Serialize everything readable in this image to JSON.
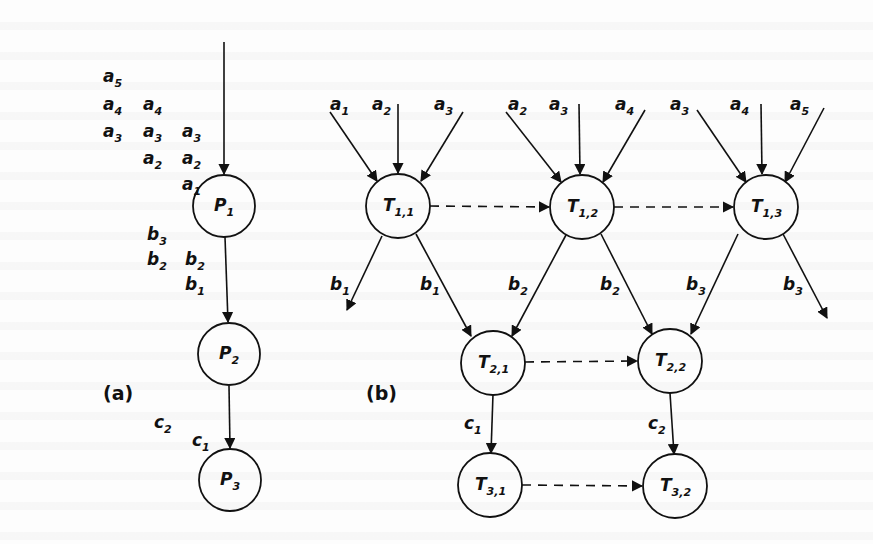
{
  "figure": {
    "panel_a": {
      "label": "(a)",
      "nodes": [
        {
          "id": "P1",
          "base": "P",
          "sub": "1",
          "cx": 224,
          "cy": 206
        },
        {
          "id": "P2",
          "base": "P",
          "sub": "2",
          "cx": 229,
          "cy": 354
        },
        {
          "id": "P3",
          "base": "P",
          "sub": "3",
          "cx": 230,
          "cy": 480
        }
      ],
      "input_stream": [
        {
          "base": "a",
          "sub": "5",
          "x": 103,
          "y": 82
        },
        {
          "base": "a",
          "sub": "4",
          "x": 103,
          "y": 110
        },
        {
          "base": "a",
          "sub": "4",
          "x": 143,
          "y": 110
        },
        {
          "base": "a",
          "sub": "3",
          "x": 103,
          "y": 137
        },
        {
          "base": "a",
          "sub": "3",
          "x": 143,
          "y": 137
        },
        {
          "base": "a",
          "sub": "3",
          "x": 182,
          "y": 137
        },
        {
          "base": "a",
          "sub": "2",
          "x": 143,
          "y": 164
        },
        {
          "base": "a",
          "sub": "2",
          "x": 182,
          "y": 164
        },
        {
          "base": "a",
          "sub": "1",
          "x": 182,
          "y": 190
        }
      ],
      "b_stream": [
        {
          "base": "b",
          "sub": "3",
          "x": 147,
          "y": 240
        },
        {
          "base": "b",
          "sub": "2",
          "x": 147,
          "y": 265
        },
        {
          "base": "b",
          "sub": "2",
          "x": 185,
          "y": 265
        },
        {
          "base": "b",
          "sub": "1",
          "x": 185,
          "y": 290
        }
      ],
      "c_stream": [
        {
          "base": "c",
          "sub": "2",
          "x": 154,
          "y": 428
        },
        {
          "base": "c",
          "sub": "1",
          "x": 192,
          "y": 446
        }
      ]
    },
    "panel_b": {
      "label": "(b)",
      "nodes": [
        {
          "id": "T11",
          "base": "T",
          "sub": "1,1",
          "cx": 398,
          "cy": 206
        },
        {
          "id": "T12",
          "base": "T",
          "sub": "1,2",
          "cx": 582,
          "cy": 207
        },
        {
          "id": "T13",
          "base": "T",
          "sub": "1,3",
          "cx": 766,
          "cy": 207
        },
        {
          "id": "T21",
          "base": "T",
          "sub": "2,1",
          "cx": 493,
          "cy": 363
        },
        {
          "id": "T22",
          "base": "T",
          "sub": "2,2",
          "cx": 670,
          "cy": 361
        },
        {
          "id": "T31",
          "base": "T",
          "sub": "3,1",
          "cx": 490,
          "cy": 485
        },
        {
          "id": "T32",
          "base": "T",
          "sub": "3,2",
          "cx": 675,
          "cy": 486
        }
      ],
      "input_labels": [
        {
          "base": "a",
          "sub": "1",
          "x": 330,
          "y": 110
        },
        {
          "base": "a",
          "sub": "2",
          "x": 372,
          "y": 110
        },
        {
          "base": "a",
          "sub": "3",
          "x": 434,
          "y": 110
        },
        {
          "base": "a",
          "sub": "2",
          "x": 508,
          "y": 110
        },
        {
          "base": "a",
          "sub": "3",
          "x": 549,
          "y": 110
        },
        {
          "base": "a",
          "sub": "4",
          "x": 615,
          "y": 110
        },
        {
          "base": "a",
          "sub": "3",
          "x": 670,
          "y": 110
        },
        {
          "base": "a",
          "sub": "4",
          "x": 730,
          "y": 110
        },
        {
          "base": "a",
          "sub": "5",
          "x": 790,
          "y": 110
        }
      ],
      "edge_labels": [
        {
          "base": "b",
          "sub": "1",
          "x": 330,
          "y": 290
        },
        {
          "base": "b",
          "sub": "1",
          "x": 420,
          "y": 290
        },
        {
          "base": "b",
          "sub": "2",
          "x": 508,
          "y": 290
        },
        {
          "base": "b",
          "sub": "2",
          "x": 600,
          "y": 290
        },
        {
          "base": "b",
          "sub": "3",
          "x": 686,
          "y": 290
        },
        {
          "base": "b",
          "sub": "3",
          "x": 783,
          "y": 290
        },
        {
          "base": "c",
          "sub": "1",
          "x": 464,
          "y": 429
        },
        {
          "base": "c",
          "sub": "2",
          "x": 648,
          "y": 429
        }
      ]
    },
    "colors": {
      "ink": "#111111",
      "paper": "#fdfdfd"
    }
  }
}
